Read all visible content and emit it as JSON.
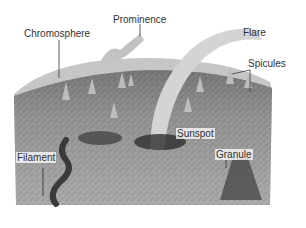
{
  "diagram": {
    "colors": {
      "background": "#ffffff",
      "photosphere": "#9a9a9a",
      "photosphere_dark": "#5e5e5e",
      "chromosphere": "#c8c8c8",
      "flare": "#d6d6d6",
      "sunspot": "#2e2e2e",
      "label_text": "#333333"
    },
    "labels": [
      {
        "id": "chromosphere",
        "text": "Chromosphere"
      },
      {
        "id": "prominence",
        "text": "Prominence"
      },
      {
        "id": "flare",
        "text": "Flare"
      },
      {
        "id": "spicules",
        "text": "Spicules"
      },
      {
        "id": "sunspot",
        "text": "Sunspot"
      },
      {
        "id": "filament",
        "text": "Filament"
      },
      {
        "id": "granule",
        "text": "Granule"
      }
    ]
  }
}
